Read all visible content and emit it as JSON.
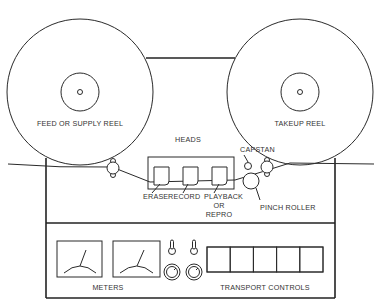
{
  "diagram": {
    "colors": {
      "line": "#2a2a2a",
      "text": "#333333",
      "background": "#ffffff"
    },
    "reels": {
      "feed": {
        "label": "FEED OR SUPPLY REEL"
      },
      "takeup": {
        "label": "TAKEUP REEL"
      }
    },
    "heads": {
      "group_label": "HEADS",
      "items": [
        {
          "label": "ERASE"
        },
        {
          "label": "RECORD"
        },
        {
          "label": "PLAYBACK"
        }
      ],
      "playback_alt_line1": "OR",
      "playback_alt_line2": "REPRO"
    },
    "capstan": {
      "label": "CAPSTAN"
    },
    "pinch_roller": {
      "label": "PINCH ROLLER"
    },
    "control_panel": {
      "meters": {
        "label": "METERS",
        "count": 2
      },
      "switches": {
        "count": 2,
        "icon": "toggle-switch-icon"
      },
      "knobs": {
        "count": 2,
        "icon": "knob-icon"
      },
      "transport_controls": {
        "label": "TRANSPORT CONTROLS",
        "button_count": 5
      }
    }
  }
}
